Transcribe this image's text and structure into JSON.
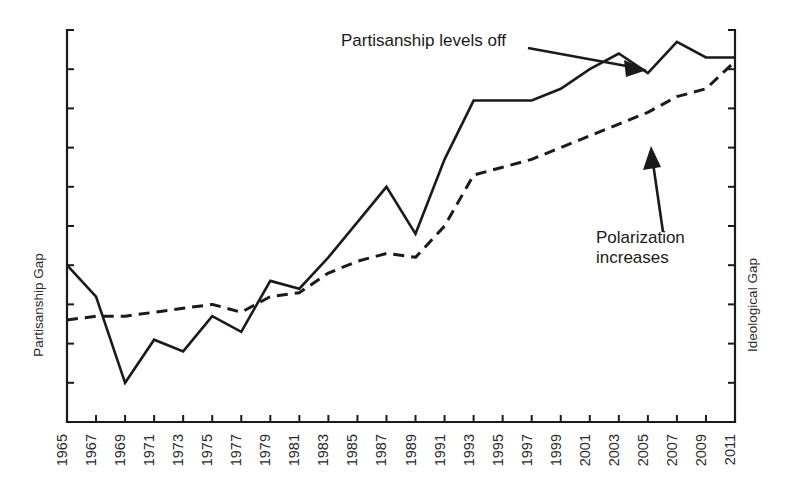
{
  "chart_data": {
    "type": "line",
    "title": "",
    "xlabel": "",
    "ylabel": "Partisanship Gap",
    "y2label": "Ideological Gap",
    "grid": false,
    "legend": "none",
    "xlim": [
      1965,
      2011
    ],
    "ylim": [
      0,
      100
    ],
    "categories": [
      "1965",
      "1966",
      "1967",
      "1968",
      "1969",
      "1970",
      "1971",
      "1972",
      "1973",
      "1974",
      "1975",
      "1976",
      "1977",
      "1978",
      "1979",
      "1980",
      "1981",
      "1982",
      "1983",
      "1984",
      "1985",
      "1986",
      "1987",
      "1988",
      "1989",
      "1990",
      "1991",
      "1992",
      "1993",
      "1994",
      "1995",
      "1996",
      "1997",
      "1998",
      "1999",
      "2000",
      "2001",
      "2002",
      "2003",
      "2004",
      "2005",
      "2006",
      "2007",
      "2008",
      "2009",
      "2010",
      "2011"
    ],
    "xticklabels": [
      "1965",
      "1967",
      "1969",
      "1971",
      "1973",
      "1975",
      "1977",
      "1979",
      "1981",
      "1983",
      "1985",
      "1987",
      "1989",
      "1991",
      "1993",
      "1995",
      "1997",
      "1999",
      "2001",
      "2003",
      "2005",
      "2007",
      "2009",
      "2011"
    ],
    "yticklabels": [],
    "series": [
      {
        "name": "Partisanship Gap",
        "style": "solid",
        "axis": "left",
        "x": [
          1965,
          1967,
          1969,
          1971,
          1973,
          1975,
          1977,
          1979,
          1981,
          1983,
          1985,
          1987,
          1989,
          1991,
          1993,
          1995,
          1997,
          1999,
          2001,
          2003,
          2005,
          2007,
          2009,
          2011
        ],
        "values": [
          40,
          32,
          10,
          21,
          18,
          27,
          23,
          36,
          34,
          42,
          51,
          60,
          48,
          67,
          82,
          82,
          82,
          85,
          90,
          94,
          89,
          97,
          93,
          93
        ]
      },
      {
        "name": "Ideological Gap",
        "style": "dashed",
        "axis": "right",
        "x": [
          1965,
          1967,
          1969,
          1971,
          1973,
          1975,
          1977,
          1979,
          1981,
          1983,
          1985,
          1987,
          1989,
          1991,
          1993,
          1995,
          1997,
          1999,
          2001,
          2003,
          2005,
          2007,
          2009,
          2011
        ],
        "values": [
          26,
          27,
          27,
          28,
          29,
          30,
          28,
          32,
          33,
          38,
          41,
          43,
          42,
          50,
          63,
          65,
          67,
          70,
          73,
          76,
          79,
          83,
          85,
          92
        ]
      }
    ],
    "annotations": [
      {
        "id": "partisanship-levels-off",
        "text": "Partisanship levels off",
        "text_x": 341,
        "text_y": 46,
        "arrow_from": [
          528,
          48
        ],
        "arrow_to": [
          645,
          70
        ]
      },
      {
        "id": "polarization-increases",
        "text_line1": "Polarization",
        "text_line2": "increases",
        "text_x": 596,
        "text_y": 243,
        "arrow_from": [
          663,
          232
        ],
        "arrow_to": [
          652,
          148
        ]
      }
    ],
    "colors": {
      "line": "#1a1a1a",
      "axis": "#1a1a1a",
      "text": "#2b2b2b",
      "background": "#ffffff"
    }
  }
}
